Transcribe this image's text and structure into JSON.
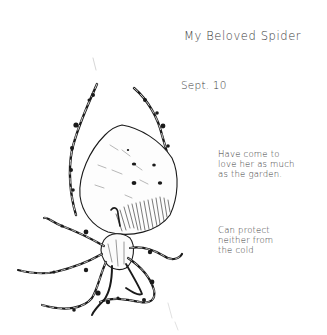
{
  "artwork": {
    "subject": "ink sketch of a spider",
    "ink_color": "#1a1a1a",
    "paper_color": "#ffffff"
  },
  "notes": {
    "title": "My Beloved Spider",
    "date": "Sept. 10",
    "note1": "Have come to\nlove her as much\nas the garden.",
    "note2": "Can protect\nneither from\nthe cold"
  }
}
